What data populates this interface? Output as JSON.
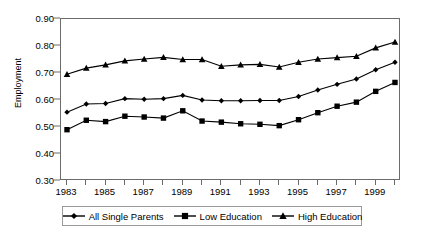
{
  "chart_data": {
    "type": "line",
    "title": "",
    "xlabel": "",
    "ylabel": "Employment",
    "grid": false,
    "legend_position": "bottom",
    "x": [
      1983,
      1984,
      1985,
      1986,
      1987,
      1988,
      1989,
      1990,
      1991,
      1992,
      1993,
      1994,
      1995,
      1996,
      1997,
      1998,
      1999,
      2000
    ],
    "xlim": [
      1983,
      2000
    ],
    "ylim": [
      0.3,
      0.9
    ],
    "xtick_labels": [
      "1983",
      "1985",
      "1987",
      "1989",
      "1991",
      "1993",
      "1995",
      "1997",
      "1999"
    ],
    "xtick_values": [
      1983,
      1985,
      1987,
      1989,
      1991,
      1993,
      1995,
      1997,
      1999
    ],
    "ytick_labels": [
      "0.30",
      "0.40",
      "0.50",
      "0.60",
      "0.70",
      "0.80",
      "0.90"
    ],
    "ytick_values": [
      0.3,
      0.4,
      0.5,
      0.6,
      0.7,
      0.8,
      0.9
    ],
    "series": [
      {
        "name": "All Single Parents",
        "marker": "diamond",
        "color": "#000000",
        "values": [
          0.555,
          0.585,
          0.587,
          0.605,
          0.603,
          0.605,
          0.617,
          0.6,
          0.597,
          0.597,
          0.598,
          0.598,
          0.613,
          0.637,
          0.658,
          0.678,
          0.712,
          0.74
        ]
      },
      {
        "name": "Low Education",
        "marker": "square",
        "color": "#000000",
        "values": [
          0.49,
          0.525,
          0.52,
          0.54,
          0.537,
          0.533,
          0.56,
          0.522,
          0.518,
          0.512,
          0.51,
          0.505,
          0.527,
          0.553,
          0.577,
          0.592,
          0.632,
          0.665
        ]
      },
      {
        "name": "High Education",
        "marker": "triangle",
        "color": "#000000",
        "values": [
          0.695,
          0.718,
          0.73,
          0.745,
          0.752,
          0.758,
          0.75,
          0.75,
          0.725,
          0.73,
          0.732,
          0.722,
          0.74,
          0.752,
          0.757,
          0.762,
          0.793,
          0.815
        ]
      }
    ]
  },
  "legend": {
    "items": [
      {
        "label": "All Single Parents",
        "marker": "diamond"
      },
      {
        "label": "Low Education",
        "marker": "square"
      },
      {
        "label": "High Education",
        "marker": "triangle"
      }
    ]
  }
}
